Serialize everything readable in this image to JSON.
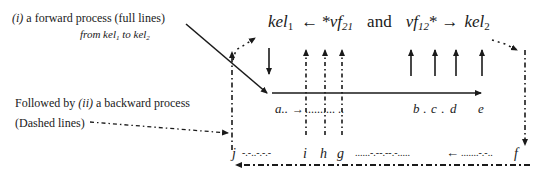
{
  "annotations": {
    "forward_label": "(i)",
    "forward_text": " a forward process (full lines)",
    "forward_sub_from": "from kel",
    "forward_sub_from_idx": "1",
    "forward_sub_to": " to kel",
    "forward_sub_to_idx": "2",
    "backward_prefix": "Followed by ",
    "backward_label": "(ii)",
    "backward_text": " a backward process",
    "backward_sub": "(Dashed lines)"
  },
  "header": {
    "kel1": "kel",
    "kel1_idx": "1",
    "arrow_left": "←",
    "vf21_star": "*vf",
    "vf21_idx": "21",
    "and": "and",
    "vf12": "vf",
    "vf12_idx": "12",
    "vf12_star": "*",
    "arrow_right": "→",
    "kel2": "kel",
    "kel2_idx": "2"
  },
  "forward_row": {
    "start": "a..",
    "arrow": "→",
    "dots": "..........  ..",
    "points": [
      "b",
      "c",
      "d",
      "e"
    ],
    "sep": "."
  },
  "backward_row": {
    "j": "j",
    "j_trail": "-.-..-.-.-",
    "points": [
      "i",
      "h",
      "g"
    ],
    "mid": "......-.--.--.-.....",
    "arrow": "←",
    "tail": ".......-.-..",
    "f": "f"
  },
  "colors": {
    "ink": "#1a1a1a",
    "background": "#ffffff"
  }
}
